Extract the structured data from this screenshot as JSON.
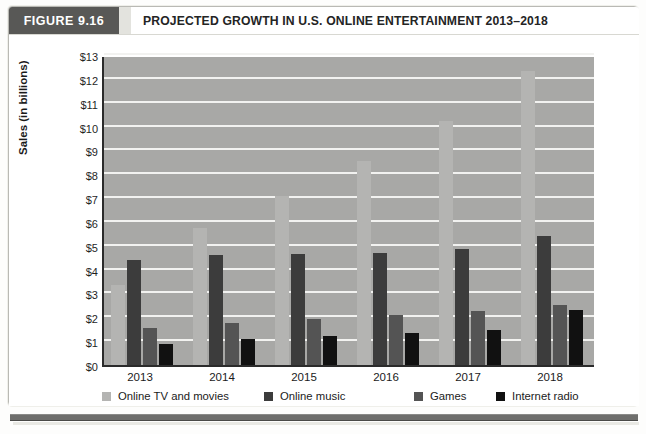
{
  "figure": {
    "tag": "FIGURE 9.16",
    "title": "PROJECTED GROWTH IN U.S. ONLINE ENTERTAINMENT 2013–2018"
  },
  "colors": {
    "figure_tag_bg": "#585856",
    "plot_bg": "#a8a8a6",
    "gridline": "#f2f2f0",
    "axis": "#2b2b2b",
    "series_online_tv": "#b4b4b2",
    "series_online_music": "#3c3c3c",
    "series_games": "#545454",
    "series_internet_radio": "#111111",
    "bottom_rule": "#6e6e6c"
  },
  "chart_data": {
    "type": "bar",
    "title": "PROJECTED GROWTH IN U.S. ONLINE ENTERTAINMENT 2013–2018",
    "xlabel": "",
    "ylabel": "Sales (in billions)",
    "categories": [
      "2013",
      "2014",
      "2015",
      "2016",
      "2017",
      "2018"
    ],
    "ylim": [
      0,
      13
    ],
    "ytick_labels": [
      "$0",
      "$1",
      "$2",
      "$3",
      "$4",
      "$5",
      "$6",
      "$7",
      "$8",
      "$9",
      "$10",
      "$11",
      "$12",
      "$13"
    ],
    "ytick_values": [
      0,
      1,
      2,
      3,
      4,
      5,
      6,
      7,
      8,
      9,
      10,
      11,
      12,
      13
    ],
    "grid": true,
    "legend_position": "bottom",
    "series": [
      {
        "name": "Online TV and movies",
        "color": "#b4b4b2",
        "values": [
          3.35,
          5.75,
          7.1,
          8.55,
          10.25,
          12.35
        ]
      },
      {
        "name": "Online music",
        "color": "#3c3c3c",
        "values": [
          4.4,
          4.6,
          4.65,
          4.7,
          4.85,
          5.4
        ]
      },
      {
        "name": "Games",
        "color": "#545454",
        "values": [
          1.55,
          1.75,
          1.95,
          2.1,
          2.25,
          2.5
        ]
      },
      {
        "name": "Internet radio",
        "color": "#111111",
        "values": [
          0.9,
          1.1,
          1.2,
          1.35,
          1.45,
          2.3
        ]
      }
    ]
  }
}
